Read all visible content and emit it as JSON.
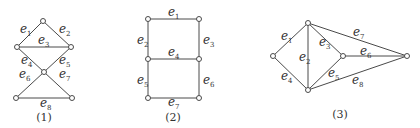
{
  "figures": [
    {
      "caption": "(1)",
      "nodes": [
        [
          43,
          21
        ],
        [
          17,
          47
        ],
        [
          71,
          47
        ],
        [
          44,
          72
        ],
        [
          16,
          98
        ],
        [
          72,
          98
        ]
      ],
      "edges": [
        {
          "label": "e",
          "sub": "1",
          "from": 0,
          "to": 1,
          "lx": 20,
          "ly": 33
        },
        {
          "label": "e",
          "sub": "2",
          "from": 0,
          "to": 2,
          "lx": 59,
          "ly": 33
        },
        {
          "label": "e",
          "sub": "3",
          "from": 1,
          "to": 2,
          "lx": 38,
          "ly": 44
        },
        {
          "label": "e",
          "sub": "4",
          "from": 1,
          "to": 3,
          "lx": 21,
          "ly": 64
        },
        {
          "label": "e",
          "sub": "5",
          "from": 2,
          "to": 3,
          "lx": 59,
          "ly": 64
        },
        {
          "label": "e",
          "sub": "6",
          "from": 3,
          "to": 4,
          "lx": 19,
          "ly": 78
        },
        {
          "label": "e",
          "sub": "7",
          "from": 3,
          "to": 5,
          "lx": 59,
          "ly": 78
        },
        {
          "label": "e",
          "sub": "8",
          "from": 4,
          "to": 5,
          "lx": 40,
          "ly": 107
        }
      ],
      "cap_x": 44,
      "cap_y": 121
    },
    {
      "caption": "(2)",
      "nodes": [
        [
          148,
          19
        ],
        [
          199,
          19
        ],
        [
          148,
          59
        ],
        [
          199,
          59
        ],
        [
          148,
          98
        ],
        [
          199,
          98
        ]
      ],
      "edges": [
        {
          "label": "e",
          "sub": "1",
          "from": 0,
          "to": 1,
          "lx": 168,
          "ly": 16
        },
        {
          "label": "e",
          "sub": "2",
          "from": 0,
          "to": 2,
          "lx": 137,
          "ly": 44
        },
        {
          "label": "e",
          "sub": "3",
          "from": 1,
          "to": 3,
          "lx": 203,
          "ly": 44
        },
        {
          "label": "e",
          "sub": "4",
          "from": 2,
          "to": 3,
          "lx": 168,
          "ly": 56
        },
        {
          "label": "e",
          "sub": "5",
          "from": 2,
          "to": 4,
          "lx": 137,
          "ly": 84
        },
        {
          "label": "e",
          "sub": "6",
          "from": 3,
          "to": 5,
          "lx": 203,
          "ly": 84
        },
        {
          "label": "e",
          "sub": "7",
          "from": 4,
          "to": 5,
          "lx": 168,
          "ly": 106
        }
      ],
      "cap_x": 173,
      "cap_y": 121
    },
    {
      "caption": "(3)",
      "nodes": [
        [
          308,
          23
        ],
        [
          273,
          56
        ],
        [
          308,
          90
        ],
        [
          343,
          56
        ],
        [
          407,
          56
        ]
      ],
      "edges": [
        {
          "label": "e",
          "sub": "1",
          "from": 0,
          "to": 1,
          "lx": 281,
          "ly": 40
        },
        {
          "label": "e",
          "sub": "2",
          "from": 0,
          "to": 2,
          "lx": 299,
          "ly": 61
        },
        {
          "label": "e",
          "sub": "3",
          "from": 0,
          "to": 3,
          "lx": 319,
          "ly": 46
        },
        {
          "label": "e",
          "sub": "4",
          "from": 1,
          "to": 2,
          "lx": 281,
          "ly": 80
        },
        {
          "label": "e",
          "sub": "5",
          "from": 3,
          "to": 2,
          "lx": 328,
          "ly": 77
        },
        {
          "label": "e",
          "sub": "6",
          "from": 3,
          "to": 4,
          "lx": 360,
          "ly": 55
        },
        {
          "label": "e",
          "sub": "7",
          "from": 0,
          "to": 4,
          "lx": 353,
          "ly": 36
        },
        {
          "label": "e",
          "sub": "8",
          "from": 2,
          "to": 4,
          "lx": 352,
          "ly": 84
        }
      ],
      "cap_x": 340,
      "cap_y": 118
    }
  ]
}
